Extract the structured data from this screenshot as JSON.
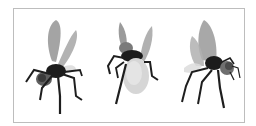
{
  "figure": {
    "border_color": "#bdbdbd",
    "background": "#ffffff",
    "flies": [
      {
        "view": "front-left",
        "body_color": "#1c1c1c",
        "wing_color": "#9a9a9a",
        "head_color": "#6a6a6a"
      },
      {
        "view": "rear",
        "body_color": "#1c1c1c",
        "wing_color": "#a8a8a8",
        "abdomen_color": "#d6d6d6"
      },
      {
        "view": "side-right",
        "body_color": "#1c1c1c",
        "wing_color": "#9e9e9e",
        "head_color": "#6f6f6f"
      }
    ]
  }
}
